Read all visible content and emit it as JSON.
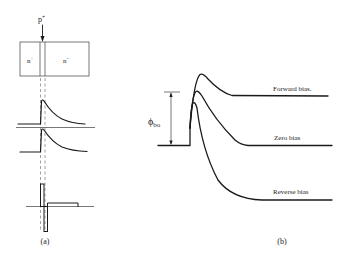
{
  "panel_a": {
    "caption": "(a)",
    "device": {
      "p_plus_label": "p",
      "p_plus_sup": "+",
      "n_plus_label": "n",
      "n_plus_sup": "+",
      "n_minus_label": "n",
      "n_minus_sup": "−"
    }
  },
  "panel_b": {
    "caption": "(b)",
    "barrier_label": "ϕ",
    "barrier_sub": "bo",
    "curves": [
      {
        "label": "Forward bias."
      },
      {
        "label": "Zero bias"
      },
      {
        "label": "Reverse bias"
      }
    ]
  },
  "colors": {
    "line": "#1a1a1a",
    "guide": "#888888",
    "background": "#ffffff"
  }
}
